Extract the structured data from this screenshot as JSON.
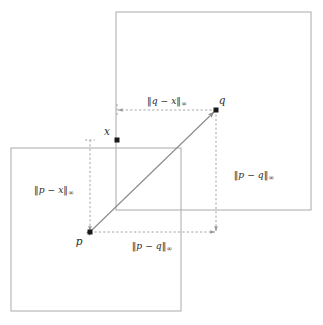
{
  "figure": {
    "background_color": "#ffffff",
    "square_stroke_color": "#aaaaaa",
    "dashed_stroke_color": "#9a9a9a",
    "diagonal_stroke_color": "#8c8c8c",
    "point_color": "#1a1a1a"
  },
  "points": [
    {
      "id": "p",
      "label": "p",
      "x": 90,
      "y": 232,
      "label_x": 79,
      "label_y": 243
    },
    {
      "id": "q",
      "label": "q",
      "x": 216,
      "y": 110,
      "label_x": 221,
      "label_y": 105
    },
    {
      "id": "x",
      "label": "x",
      "x": 117,
      "y": 140,
      "label_x": 107,
      "label_y": 134
    }
  ],
  "squares": [
    {
      "id": "square-p",
      "name": "lower-left-ball",
      "x": 11,
      "y": 148,
      "width": 170,
      "height": 163
    },
    {
      "id": "square-q",
      "name": "upper-right-ball",
      "x": 116,
      "y": 12,
      "width": 195,
      "height": 198
    }
  ],
  "measures": [
    {
      "id": "q-minus-x",
      "position": "top",
      "lhs": "q",
      "rhs": "x",
      "subscript": "∞",
      "label_text": "‖q − x‖∞",
      "label_x": 167,
      "label_y": 104,
      "from_x": 117,
      "from_y": 110,
      "to_x": 216,
      "to_y": 110
    },
    {
      "id": "p-minus-q-vertical",
      "position": "right",
      "lhs": "p",
      "rhs": "q",
      "subscript": "∞",
      "label_text": "‖p − q‖∞",
      "label_x": 254,
      "label_y": 175,
      "from_x": 216,
      "from_y": 110,
      "to_x": 216,
      "to_y": 232
    },
    {
      "id": "p-minus-x",
      "position": "left",
      "lhs": "p",
      "rhs": "x",
      "subscript": "∞",
      "label_text": "‖p − x‖∞",
      "label_x": 54,
      "label_y": 190,
      "from_x": 90,
      "from_y": 140,
      "to_x": 90,
      "to_y": 232
    },
    {
      "id": "p-minus-q-horizontal",
      "position": "bottom",
      "lhs": "p",
      "rhs": "q",
      "subscript": "∞",
      "label_text": "‖p − q‖∞",
      "label_x": 152,
      "label_y": 247,
      "from_x": 90,
      "from_y": 232,
      "to_x": 216,
      "to_y": 232
    }
  ],
  "connector": {
    "id": "p-to-q-arrow",
    "from": "p",
    "to": "q",
    "double_headed": true,
    "from_x": 90,
    "from_y": 232,
    "to_x": 216,
    "to_y": 110
  }
}
